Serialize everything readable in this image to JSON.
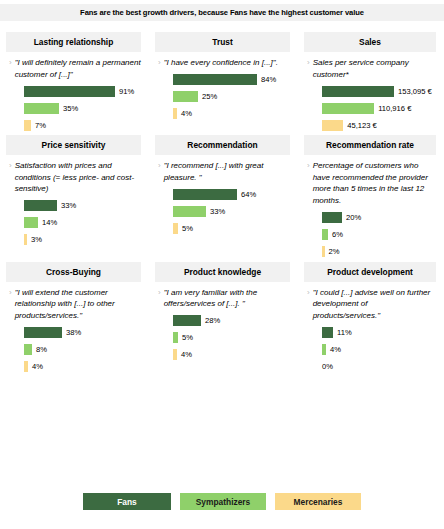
{
  "banner": {
    "text": "Fans are the best growth drivers, because Fans have the highest customer value"
  },
  "colors": {
    "fans": "#3c6b41",
    "sympathizers": "#8fd06a",
    "mercenaries": "#fbd98a",
    "band": "#f1f1f1",
    "chevron": "#bdbdbd"
  },
  "legend": {
    "items": [
      {
        "label": "Fans",
        "color": "#3c6b41"
      },
      {
        "label": "Sympathizers",
        "color": "#8fd06a"
      },
      {
        "label": "Mercenaries",
        "color": "#fbd98a"
      }
    ]
  },
  "chart_data": {
    "type": "bar",
    "title": "Fans are the best growth drivers, because Fans have the highest customer value",
    "series": [
      "Fans",
      "Sympathizers",
      "Mercenaries"
    ],
    "legend_position": "bottom",
    "grid": false,
    "panels": [
      {
        "title": "Lasting relationship",
        "description": "\"I will definitely remain a permanent customer of [...]\"",
        "unit": "%",
        "values": [
          91,
          35,
          7
        ],
        "labels": [
          "91%",
          "35%",
          "7%"
        ]
      },
      {
        "title": "Trust",
        "description": "\"I have every confidence in [...]\".",
        "unit": "%",
        "values": [
          84,
          25,
          4
        ],
        "labels": [
          "84%",
          "25%",
          "4%"
        ]
      },
      {
        "title": "Sales",
        "description": "Sales per service company customer*",
        "unit": "EUR",
        "values": [
          153095,
          110916,
          45123
        ],
        "labels": [
          "153,095 €",
          "110,916 €",
          "45,123 €"
        ]
      },
      {
        "title": "Price sensitivity",
        "description": "Satisfaction with prices and conditions (= less price- and cost-sensitive)",
        "unit": "%",
        "values": [
          33,
          14,
          3
        ],
        "labels": [
          "33%",
          "14%",
          "3%"
        ]
      },
      {
        "title": "Recommendation",
        "description": "\"I recommend [...] with great pleasure. \"",
        "unit": "%",
        "values": [
          64,
          33,
          5
        ],
        "labels": [
          "64%",
          "33%",
          "5%"
        ]
      },
      {
        "title": "Recommendation rate",
        "description": "Percentage of customers who have recommended the provider more than 5 times in the last 12 months.",
        "unit": "%",
        "values": [
          20,
          6,
          2
        ],
        "labels": [
          "20%",
          "6%",
          "2%"
        ]
      },
      {
        "title": "Cross-Buying",
        "description": "\"I will extend the customer relationship with [...] to other products/services.\"",
        "unit": "%",
        "values": [
          38,
          8,
          4
        ],
        "labels": [
          "38%",
          "8%",
          "4%"
        ]
      },
      {
        "title": "Product knowledge",
        "description": "\"I am very familiar with the offers/services of [...]. \"",
        "unit": "%",
        "values": [
          28,
          5,
          4
        ],
        "labels": [
          "28%",
          "5%",
          "4%"
        ]
      },
      {
        "title": "Product development",
        "description": "\"I could [...] advise well on further development of products/services.\"",
        "unit": "%",
        "values": [
          11,
          4,
          0
        ],
        "labels": [
          "11%",
          "4%",
          "0%"
        ]
      }
    ]
  }
}
